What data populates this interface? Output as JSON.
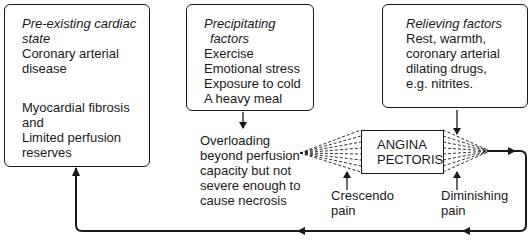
{
  "diagram": {
    "pre_existing": {
      "title": [
        "Pre-existing cardiac",
        "state"
      ],
      "lines_top": [
        "Coronary arterial",
        "disease"
      ],
      "lines_bottom": [
        "Myocardial fibrosis",
        "and",
        "Limited perfusion",
        "reserves"
      ]
    },
    "precipitating": {
      "title": [
        "Precipitating",
        "factors"
      ],
      "lines": [
        "Exercise",
        "Emotional stress",
        "Exposure to cold",
        "A heavy meal"
      ]
    },
    "relieving": {
      "title": "Relieving factors",
      "lines": [
        "Rest, warmth,",
        "coronary arterial",
        "dilating drugs,",
        "e.g. nitrites."
      ]
    },
    "overloading": {
      "lines": [
        "Overloading",
        "beyond perfusion",
        "capacity but not",
        "severe enough to",
        "cause necrosis"
      ]
    },
    "angina": {
      "lines": [
        "ANGINA",
        "PECTORIS"
      ]
    },
    "crescendo": [
      "Crescendo",
      "pain"
    ],
    "diminishing": [
      "Diminishing",
      "pain"
    ],
    "colors": {
      "ink": "#1a1a1a",
      "background": "#ffffff"
    }
  }
}
